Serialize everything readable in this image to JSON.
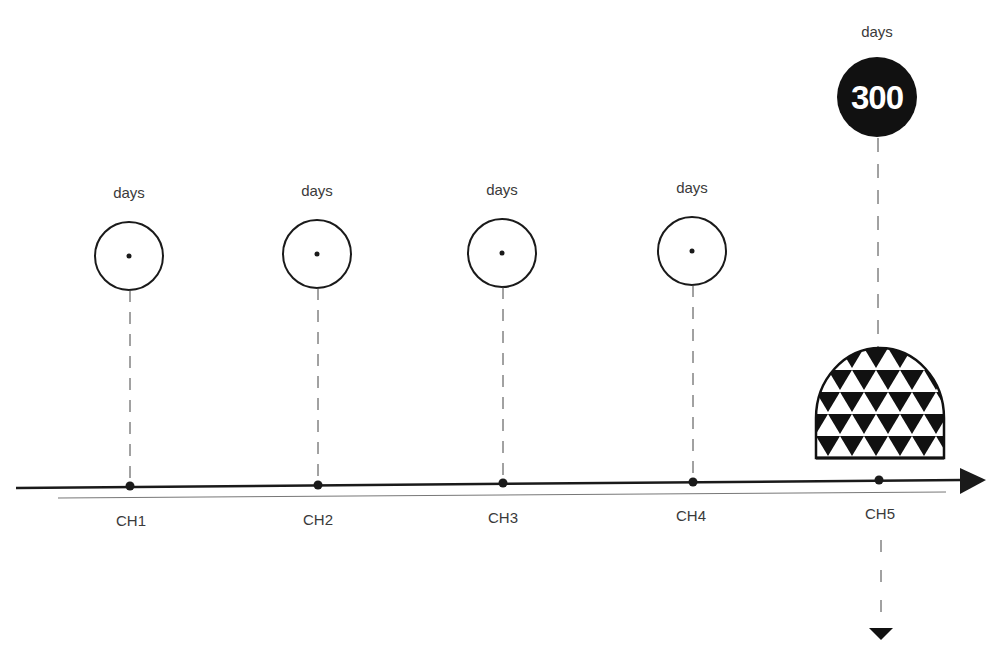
{
  "diagram": {
    "type": "timeline",
    "axis": {
      "direction": "left-to-right",
      "arrow": "right",
      "color": "#1a1a1a"
    },
    "milestones": [
      {
        "id": "CH1",
        "label": "CH1",
        "unit_label": "days",
        "value": "",
        "marker": "open-circle-with-dot"
      },
      {
        "id": "CH2",
        "label": "CH2",
        "unit_label": "days",
        "value": "",
        "marker": "open-circle-with-dot"
      },
      {
        "id": "CH3",
        "label": "CH3",
        "unit_label": "days",
        "value": "",
        "marker": "open-circle-with-dot"
      },
      {
        "id": "CH4",
        "label": "CH4",
        "unit_label": "days",
        "value": "",
        "marker": "open-circle-with-dot"
      },
      {
        "id": "CH5",
        "label": "CH5",
        "unit_label": "days",
        "value": "300",
        "marker": "filled-circle-with-number",
        "extra_shape": "triangle-pattern-dome",
        "continuation": "down-arrow"
      }
    ],
    "colors": {
      "ink": "#1a1a1a",
      "text": "#3a3a3a",
      "fill_dark": "#111111",
      "background": "#ffffff"
    }
  }
}
